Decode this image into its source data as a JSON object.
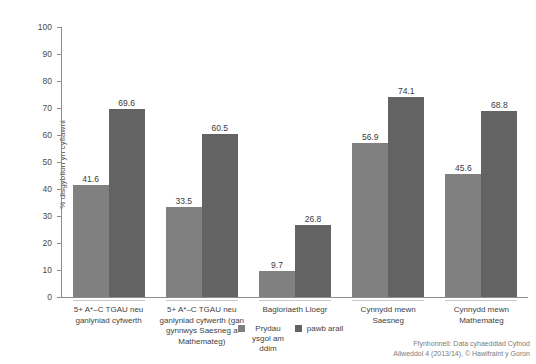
{
  "chart_data": {
    "type": "bar",
    "title": "",
    "xlabel": "",
    "ylabel": "% disgyblion yn cyflawni",
    "ylim": [
      0,
      100
    ],
    "ytick_step": 10,
    "yticks": [
      0,
      10,
      20,
      30,
      40,
      50,
      60,
      70,
      80,
      90,
      100
    ],
    "grid": false,
    "legend_position": "bottom-center",
    "categories": [
      "5+ A*–C TGAU neu ganlyniad cyfwerth",
      "5+ A*–C TGAU neu ganlyniad cyfwerth (gan gynnwys Saesneg a Mathemateg)",
      "Bagloriaeth Lloegr",
      "Cynnydd mewn Saesneg",
      "Cynnydd mewn Mathemateg"
    ],
    "series": [
      {
        "name": "Prydau ysgol am ddim",
        "color": "#808080",
        "values": [
          41.6,
          33.5,
          9.7,
          56.9,
          45.6
        ]
      },
      {
        "name": "pawb arall",
        "color": "#636363",
        "values": [
          69.6,
          60.5,
          26.8,
          74.1,
          68.8
        ]
      }
    ]
  },
  "axis": {
    "y_title": "% disgyblion yn cyflawni",
    "tick_labels": [
      "100",
      "90",
      "80",
      "70",
      "60",
      "50",
      "40",
      "30",
      "20",
      "10",
      "0"
    ]
  },
  "category_labels": [
    "5+ A*–C TGAU neu ganlyniad cyfwerth",
    "5+ A*–C TGAU neu ganlyniad cyfwerth (gan gynnwys Saesneg a Mathemateg)",
    "Bagloriaeth Lloegr",
    "Cynnydd mewn Saesneg",
    "Cynnydd mewn Mathemateg"
  ],
  "legend": [
    {
      "label": "Prydau ysgol am ddim",
      "color": "#808080"
    },
    {
      "label": "pawb arall",
      "color": "#636363"
    }
  ],
  "source": {
    "line1": "Ffynhonnell: Data cyhaeddiad Cyfnod",
    "line2": "Allweddol 4 (2013/14), © Hawlfraint y Goron"
  },
  "colors": {
    "series_light": "#808080",
    "series_dark": "#636363",
    "axis": "#8d8d8d",
    "text": "#3a3a3a",
    "muted_text": "#7b7b7b",
    "background": "#ffffff"
  }
}
